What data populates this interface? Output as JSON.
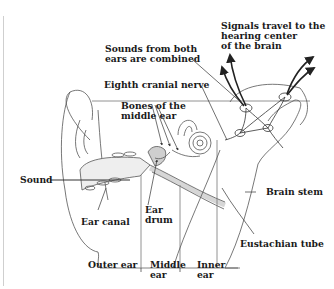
{
  "diagram": {
    "labels": {
      "signals": [
        "Signals travel to the",
        "hearing center",
        "of the brain"
      ],
      "sounds_combined": [
        "Sounds from both",
        "ears are combined"
      ],
      "eighth_nerve": "Eighth cranial nerve",
      "bones": [
        "Bones of the",
        "middle ear"
      ],
      "sound": "Sound",
      "ear_canal": "Ear canal",
      "ear_drum": [
        "Ear",
        "drum"
      ],
      "brain_stem": "Brain stem",
      "eustachian": "Eustachian tube",
      "outer_ear": "Outer ear",
      "middle_ear": [
        "Middle",
        "ear"
      ],
      "inner_ear": [
        "Inner",
        "ear"
      ]
    },
    "colors": {
      "line": "#4a4a4a",
      "text": "#1a1a1a",
      "background": "#ffffff"
    }
  }
}
